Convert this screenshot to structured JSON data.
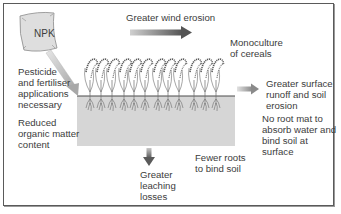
{
  "diagram": {
    "bag_label": "NPK",
    "labels": {
      "wind": "Greater wind erosion",
      "monoculture": "Monoculture\nof cereals",
      "pesticide": "Pesticide\nand fertiliser\napplications\nnecessary",
      "organic": "Reduced\norganic matter\ncontent",
      "runoff": "Greater surface\nrunoff and soil\nerosion",
      "rootmat": "No root mat to\nabsorb water and\nbind soil at surface",
      "fewer_roots": "Fewer roots\nto bind soil",
      "leaching": "Greater\nleaching\nlosses"
    },
    "colors": {
      "soil": "#d6d6d6",
      "soil_line": "#4a4a4a",
      "arrow_dark": "#5a5a5a",
      "arrow_light": "#c8c8c8",
      "bag_fill": "#dcdcdc",
      "plant": "#6a6a6a"
    },
    "plant_count": 12
  }
}
